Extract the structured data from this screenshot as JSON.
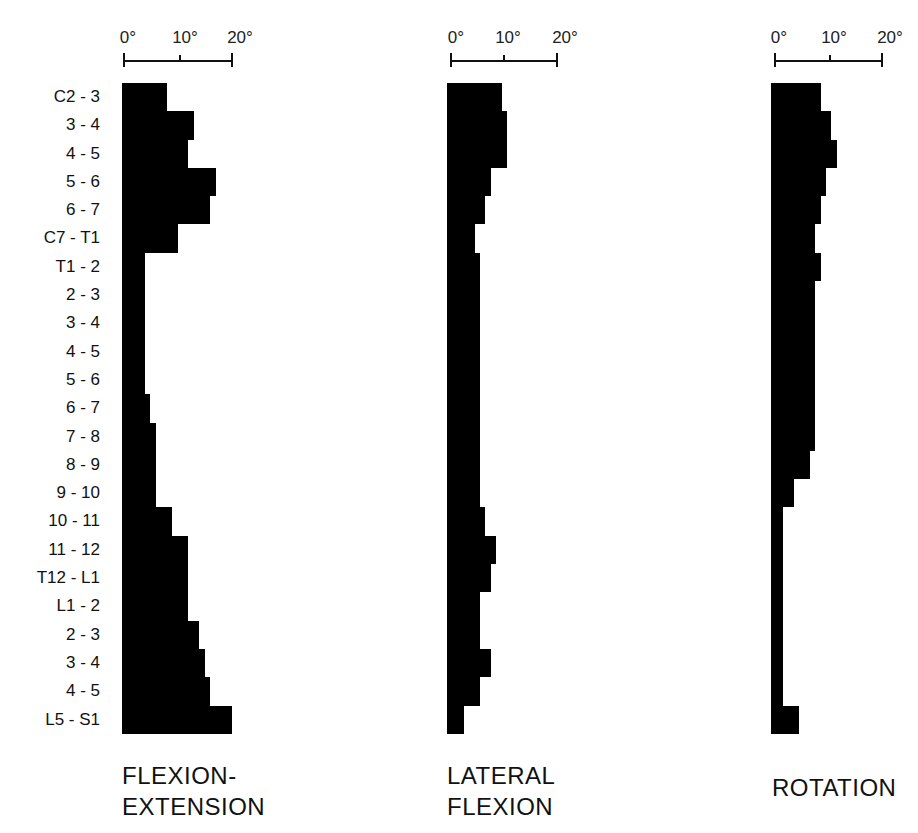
{
  "chart_data": [
    {
      "type": "bar",
      "orientation": "horizontal",
      "title": "FLEXION-\nEXTENSION",
      "title_lines": [
        "FLEXION-",
        "EXTENSION"
      ],
      "xlabel": "",
      "ylabel": "",
      "xlim": [
        0,
        20
      ],
      "xticks": [
        "0°",
        "10°",
        "20°"
      ],
      "grid": false,
      "categories": [
        "C2 - 3",
        "3 - 4",
        "4 - 5",
        "5 - 6",
        "6 - 7",
        "C7 - T1",
        "T1 - 2",
        "2 - 3",
        "3 - 4",
        "4 - 5",
        "5 - 6",
        "6 - 7",
        "7 - 8",
        "8 - 9",
        "9 - 10",
        "10 - 11",
        "11 - 12",
        "T12 - L1",
        "L1 - 2",
        "2 - 3",
        "3 - 4",
        "4 - 5",
        "L5 - S1"
      ],
      "values": [
        8,
        13,
        12,
        17,
        16,
        10,
        4,
        4,
        4,
        4,
        4,
        5,
        6,
        6,
        6,
        9,
        12,
        12,
        12,
        14,
        15,
        16,
        20
      ]
    },
    {
      "type": "bar",
      "orientation": "horizontal",
      "title": "LATERAL\nFLEXION",
      "title_lines": [
        "LATERAL",
        "FLEXION"
      ],
      "xlabel": "",
      "ylabel": "",
      "xlim": [
        0,
        20
      ],
      "xticks": [
        "0°",
        "10°",
        "20°"
      ],
      "grid": false,
      "categories": [
        "C2 - 3",
        "3 - 4",
        "4 - 5",
        "5 - 6",
        "6 - 7",
        "C7 - T1",
        "T1 - 2",
        "2 - 3",
        "3 - 4",
        "4 - 5",
        "5 - 6",
        "6 - 7",
        "7 - 8",
        "8 - 9",
        "9 - 10",
        "10 - 11",
        "11 - 12",
        "T12 - L1",
        "L1 - 2",
        "2 - 3",
        "3 - 4",
        "4 - 5",
        "L5 - S1"
      ],
      "values": [
        10,
        11,
        11,
        8,
        7,
        5,
        6,
        6,
        6,
        6,
        6,
        6,
        6,
        6,
        6,
        7,
        9,
        8,
        6,
        6,
        8,
        6,
        3
      ]
    },
    {
      "type": "bar",
      "orientation": "horizontal",
      "title": "ROTATION",
      "title_lines": [
        "ROTATION"
      ],
      "xlabel": "",
      "ylabel": "",
      "xlim": [
        0,
        20
      ],
      "xticks": [
        "0°",
        "10°",
        "20°"
      ],
      "grid": false,
      "categories": [
        "C2 - 3",
        "3 - 4",
        "4 - 5",
        "5 - 6",
        "6 - 7",
        "C7 - T1",
        "T1 - 2",
        "2 - 3",
        "3 - 4",
        "4 - 5",
        "5 - 6",
        "6 - 7",
        "7 - 8",
        "8 - 9",
        "9 - 10",
        "10 - 11",
        "11 - 12",
        "T12 - L1",
        "L1 - 2",
        "2 - 3",
        "3 - 4",
        "4 - 5",
        "L5 - S1"
      ],
      "values": [
        9,
        11,
        12,
        10,
        9,
        8,
        9,
        8,
        8,
        8,
        8,
        8,
        8,
        7,
        4,
        2,
        2,
        2,
        2,
        2,
        2,
        2,
        5
      ]
    }
  ],
  "row_labels": [
    "C2 - 3",
    "3 - 4",
    "4 - 5",
    "5 - 6",
    "6 - 7",
    "C7 - T1",
    "T1 - 2",
    "2 - 3",
    "3 - 4",
    "4 - 5",
    "5 - 6",
    "6 - 7",
    "7 - 8",
    "8 - 9",
    "9 - 10",
    "10 - 11",
    "11 - 12",
    "T12 - L1",
    "L1 - 2",
    "2 - 3",
    "3 - 4",
    "4 - 5",
    "L5 - S1"
  ],
  "panels": [
    {
      "title_lines": [
        "FLEXION-",
        "EXTENSION"
      ],
      "ticks": [
        "0°",
        "10°",
        "20°"
      ]
    },
    {
      "title_lines": [
        "LATERAL",
        "FLEXION"
      ],
      "ticks": [
        "0°",
        "10°",
        "20°"
      ]
    },
    {
      "title_lines": [
        "ROTATION"
      ],
      "ticks": [
        "0°",
        "10°",
        "20°"
      ]
    }
  ],
  "colors": {
    "bar": "#000000",
    "background": "#ffffff",
    "text": "#111111"
  }
}
